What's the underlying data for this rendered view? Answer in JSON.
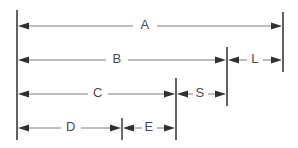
{
  "drawing": {
    "type": "engineering-dimension-diagram",
    "description": "Stacked horizontal dimension lines with arrowheads labeled A, B, L, C, S, D, E",
    "canvas": {
      "width": 298,
      "height": 148,
      "background": "#ffffff"
    },
    "colors": {
      "extension_line": "#3a3a3a",
      "dimension_line": "#6b6b6b",
      "arrow_head": "#2f2f2f",
      "label_text": "#4a4a4a"
    },
    "extension_lines": [
      {
        "name": "left-datum",
        "x": 17,
        "y1": 10,
        "y2": 140
      },
      {
        "name": "right-outer",
        "x": 283,
        "y1": 12,
        "y2": 72
      },
      {
        "name": "mid-right",
        "x": 227,
        "y1": 47,
        "y2": 106
      },
      {
        "name": "mid-left",
        "x": 176,
        "y1": 78,
        "y2": 140
      },
      {
        "name": "e-tick",
        "x": 122,
        "y1": 118,
        "y2": 140
      }
    ],
    "rows": [
      {
        "id": "row-a",
        "y": 26,
        "dimensions": [
          {
            "label": "A",
            "x1": 17,
            "x2": 283,
            "label_x": 145,
            "arrows": "both"
          }
        ]
      },
      {
        "id": "row-b-l",
        "y": 60,
        "dimensions": [
          {
            "label": "B",
            "x1": 17,
            "x2": 227,
            "label_x": 117,
            "arrows": "both"
          },
          {
            "label": "L",
            "x1": 227,
            "x2": 283,
            "label_x": 255,
            "arrows": "both"
          }
        ]
      },
      {
        "id": "row-c-s",
        "y": 94,
        "dimensions": [
          {
            "label": "C",
            "x1": 17,
            "x2": 176,
            "label_x": 98,
            "arrows": "both"
          },
          {
            "label": "S",
            "x1": 176,
            "x2": 227,
            "label_x": 200,
            "arrows": "both"
          }
        ]
      },
      {
        "id": "row-d-e",
        "y": 128,
        "dimensions": [
          {
            "label": "D",
            "x1": 17,
            "x2": 122,
            "label_x": 71,
            "arrows": "both"
          },
          {
            "label": "E",
            "x1": 122,
            "x2": 176,
            "label_x": 149,
            "arrows": "both"
          }
        ]
      }
    ],
    "labels": {
      "a": "A",
      "b": "B",
      "l": "L",
      "c": "C",
      "s": "S",
      "d": "D",
      "e": "E"
    }
  }
}
